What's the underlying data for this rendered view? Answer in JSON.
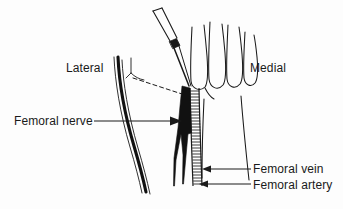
{
  "figure": {
    "background_color": "#fdfdfd",
    "ink_color": "#1a1a1a"
  },
  "labels": {
    "lateral": "Lateral",
    "medial": "Medial",
    "femoral_nerve": "Femoral nerve",
    "femoral_vein": "Femoral vein",
    "femoral_artery": "Femoral artery"
  },
  "structures": {
    "syringe_needle": "syringe-needle",
    "palpating_hand": "palpating-hand",
    "femoral_nerve_shape": "femoral-nerve",
    "femoral_vessels_band": "femoral-vessels",
    "inguinal_ligament_dashes": "inguinal-ligament",
    "thigh_contour": "thigh-contour"
  },
  "leader_lines": {
    "femoral_nerve_arrow": "arrow-right",
    "femoral_vein_arrow": "arrow-left",
    "femoral_artery_arrow": "arrow-left"
  }
}
